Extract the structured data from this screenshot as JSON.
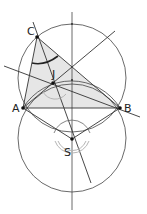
{
  "figure": {
    "colors": {
      "stroke": "#333333",
      "triangle_fill": "#e6e6e6",
      "angle_arc_gray": "#b5b5b5",
      "angle_arc_dark": "#222222"
    }
  },
  "points": {
    "A": {
      "label": "A",
      "x": 23,
      "y": 108
    },
    "B": {
      "label": "B",
      "x": 120,
      "y": 108
    },
    "C": {
      "label": "C",
      "x": 37,
      "y": 37
    },
    "J": {
      "label": "J",
      "x": 53,
      "y": 83
    },
    "S": {
      "label": "S",
      "x": 72,
      "y": 139
    }
  },
  "labels": {
    "A": "A",
    "B": "B",
    "C": "C",
    "J": "J",
    "S": "S"
  }
}
